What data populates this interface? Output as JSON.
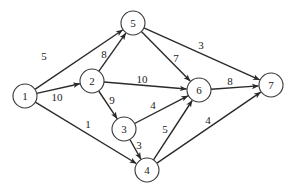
{
  "diagram": {
    "type": "directed-weighted-graph",
    "node_radius": 12,
    "colors": {
      "stroke": "#2a2a2a",
      "node_fill": "#ffffff",
      "text": "#222222"
    },
    "nodes": [
      {
        "id": "1",
        "label": "1",
        "x": 25,
        "y": 96
      },
      {
        "id": "2",
        "label": "2",
        "x": 92,
        "y": 81
      },
      {
        "id": "3",
        "label": "3",
        "x": 124,
        "y": 129
      },
      {
        "id": "4",
        "label": "4",
        "x": 147,
        "y": 170
      },
      {
        "id": "5",
        "label": "5",
        "x": 133,
        "y": 23
      },
      {
        "id": "6",
        "label": "6",
        "x": 199,
        "y": 90
      },
      {
        "id": "7",
        "label": "7",
        "x": 271,
        "y": 85
      }
    ],
    "edges": [
      {
        "from": "1",
        "to": "5",
        "weight": "5",
        "label_x": 44,
        "label_y": 56
      },
      {
        "from": "1",
        "to": "2",
        "weight": "10",
        "label_x": 57,
        "label_y": 97
      },
      {
        "from": "1",
        "to": "4",
        "weight": "1",
        "label_x": 88,
        "label_y": 124
      },
      {
        "from": "2",
        "to": "5",
        "weight": "8",
        "label_x": 104,
        "label_y": 54
      },
      {
        "from": "2",
        "to": "6",
        "weight": "10",
        "label_x": 142,
        "label_y": 79
      },
      {
        "from": "2",
        "to": "3",
        "weight": "9",
        "label_x": 112,
        "label_y": 100
      },
      {
        "from": "5",
        "to": "6",
        "weight": "7",
        "label_x": 176,
        "label_y": 58
      },
      {
        "from": "5",
        "to": "7",
        "weight": "3",
        "label_x": 201,
        "label_y": 45
      },
      {
        "from": "6",
        "to": "7",
        "weight": "8",
        "label_x": 230,
        "label_y": 81
      },
      {
        "from": "3",
        "to": "6",
        "weight": "4",
        "label_x": 153,
        "label_y": 105
      },
      {
        "from": "3",
        "to": "4",
        "weight": "3",
        "label_x": 139,
        "label_y": 145
      },
      {
        "from": "4",
        "to": "6",
        "weight": "5",
        "label_x": 165,
        "label_y": 129
      },
      {
        "from": "4",
        "to": "7",
        "weight": "4",
        "label_x": 208,
        "label_y": 120
      }
    ]
  }
}
